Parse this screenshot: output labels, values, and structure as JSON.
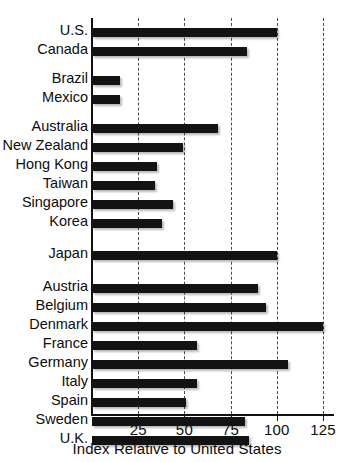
{
  "chart_data": {
    "type": "bar",
    "orientation": "horizontal",
    "title": "",
    "xlabel": "Index Relative to United States",
    "ylabel": "",
    "xlim": [
      0,
      135
    ],
    "xticks": [
      25,
      50,
      75,
      100,
      125
    ],
    "xtick_labels": [
      "25",
      "50",
      "75",
      "100",
      "125"
    ],
    "grid": "vertical dashed gridlines at each x tick",
    "legend": "none",
    "bar_color": "#131313",
    "categories": [
      "U.S.",
      "Canada",
      "Brazil",
      "Mexico",
      "Australia",
      "New Zealand",
      "Hong Kong",
      "Taiwan",
      "Singapore",
      "Korea",
      "Japan",
      "Austria",
      "Belgium",
      "Denmark",
      "France",
      "Germany",
      "Italy",
      "Spain",
      "Sweden",
      "U.K."
    ],
    "values": [
      100,
      84,
      15,
      15,
      68,
      49,
      35,
      34,
      44,
      38,
      100,
      90,
      94,
      125,
      57,
      106,
      57,
      51,
      83,
      85
    ],
    "groups": [
      {
        "name": "Americas",
        "categories": [
          "U.S.",
          "Canada"
        ]
      },
      {
        "name": "Latin America",
        "categories": [
          "Brazil",
          "Mexico"
        ]
      },
      {
        "name": "Asia-Pacific",
        "categories": [
          "Australia",
          "New Zealand",
          "Hong Kong",
          "Taiwan",
          "Singapore",
          "Korea"
        ]
      },
      {
        "name": "Japan",
        "categories": [
          "Japan"
        ]
      },
      {
        "name": "Europe",
        "categories": [
          "Austria",
          "Belgium",
          "Denmark",
          "France",
          "Germany",
          "Italy",
          "Spain",
          "Sweden",
          "U.K."
        ]
      }
    ]
  },
  "layout": {
    "rows": [
      {
        "label": "U.S.",
        "value": 100,
        "y": 28
      },
      {
        "label": "Canada",
        "value": 84,
        "y": 47
      },
      {
        "label": "Brazil",
        "value": 15,
        "y": 76
      },
      {
        "label": "Mexico",
        "value": 15,
        "y": 95
      },
      {
        "label": "Australia",
        "value": 68,
        "y": 124
      },
      {
        "label": "New Zealand",
        "value": 49,
        "y": 143
      },
      {
        "label": "Hong Kong",
        "value": 35,
        "y": 162
      },
      {
        "label": "Taiwan",
        "value": 34,
        "y": 181
      },
      {
        "label": "Singapore",
        "value": 44,
        "y": 200
      },
      {
        "label": "Korea",
        "value": 38,
        "y": 219
      },
      {
        "label": "Japan",
        "value": 100,
        "y": 251
      },
      {
        "label": "Austria",
        "value": 90,
        "y": 284
      },
      {
        "label": "Belgium",
        "value": 94,
        "y": 303
      },
      {
        "label": "Denmark",
        "value": 125,
        "y": 322
      },
      {
        "label": "France",
        "value": 57,
        "y": 341
      },
      {
        "label": "Germany",
        "value": 106,
        "y": 360
      },
      {
        "label": "Italy",
        "value": 57,
        "y": 379
      },
      {
        "label": "Spain",
        "value": 51,
        "y": 398
      },
      {
        "label": "Sweden",
        "value": 83,
        "y": 417
      },
      {
        "label": "U.K.",
        "value": 85,
        "y": 436
      }
    ]
  }
}
